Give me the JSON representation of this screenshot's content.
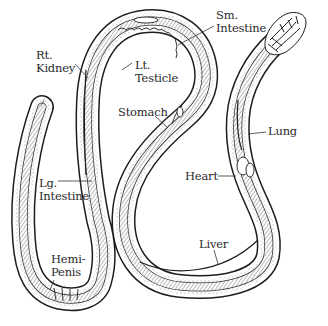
{
  "diagram": {
    "colors": {
      "ink": "#1e1e1e",
      "shade": "#8a8a8a",
      "background": "#ffffff"
    },
    "labels": [
      {
        "id": "rt-kidney",
        "text": "Rt.\nKidney",
        "x": 36,
        "y": 49
      },
      {
        "id": "lt-testicle",
        "text": "Lt.\nTesticle",
        "x": 135,
        "y": 59
      },
      {
        "id": "sm-intestine",
        "text": "Sm.\nIntestine",
        "x": 216,
        "y": 9
      },
      {
        "id": "stomach",
        "text": "Stomach",
        "x": 118,
        "y": 106
      },
      {
        "id": "lung",
        "text": "Lung",
        "x": 268,
        "y": 125
      },
      {
        "id": "heart",
        "text": "Heart",
        "x": 185,
        "y": 170
      },
      {
        "id": "lg-intestine",
        "text": "Lg.\nIntestine",
        "x": 39,
        "y": 177
      },
      {
        "id": "hemi-penis",
        "text": "Hemi-\nPenis",
        "x": 51,
        "y": 253
      },
      {
        "id": "liver",
        "text": "Liver",
        "x": 199,
        "y": 238
      }
    ]
  }
}
